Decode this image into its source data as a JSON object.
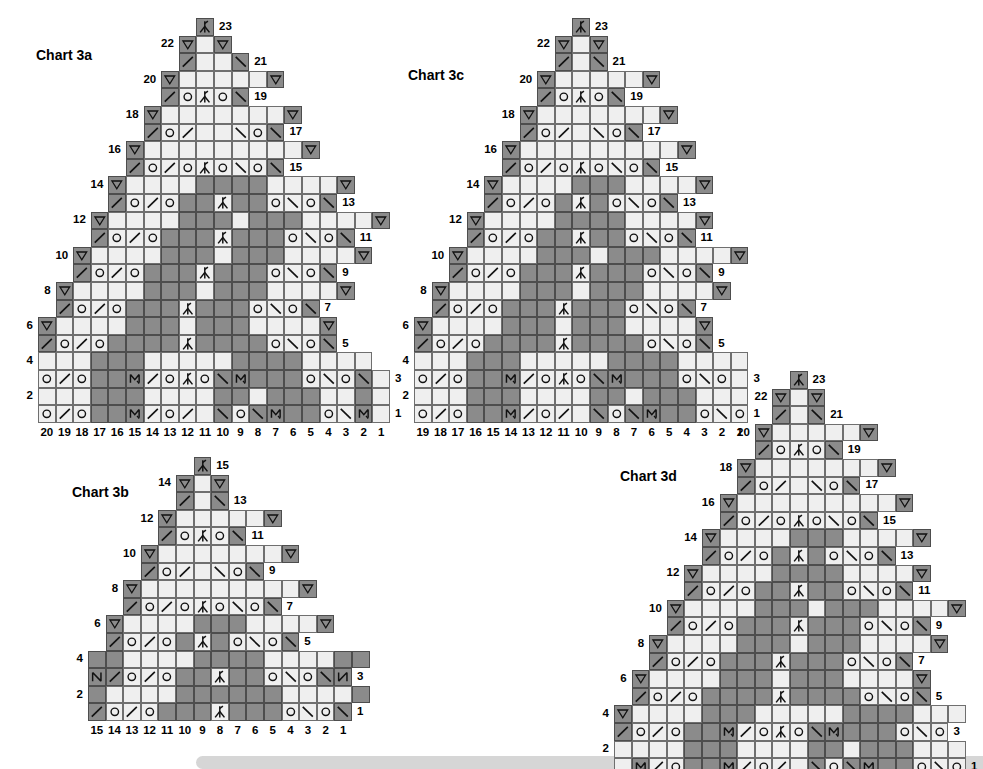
{
  "page": {
    "width": 983,
    "height": 769,
    "background": "#ffffff",
    "cell_size": 17.6,
    "colors": {
      "light_cell": "#efefef",
      "dark_cell": "#8b8b8b",
      "grid_line": "#4a4a4a",
      "text": "#000000",
      "footer_bar": "#d6d6d6"
    }
  },
  "legend_symbols": {
    "blank": "plain-stitch",
    "o": "yarn-over",
    "slash": "k2tog-right-leaning-decrease",
    "backslash": "ssk-left-leaning-decrease",
    "center": "centered-double-decrease",
    "triangle": "purl-or-no-stitch-triangle",
    "m": "make-one-stitch",
    "n": "twisted-stitch"
  },
  "charts": [
    {
      "id": "chart-3a",
      "title": "Chart 3a",
      "columns": 20,
      "rows": 23,
      "col_labels": [
        "20",
        "19",
        "18",
        "17",
        "16",
        "15",
        "14",
        "13",
        "12",
        "11",
        "10",
        "9",
        "8",
        "7",
        "6",
        "5",
        "4",
        "3",
        "2",
        "1"
      ],
      "row_labels_left": [
        "2",
        "4",
        "6",
        "8",
        "10",
        "12",
        "14",
        "16",
        "18",
        "20",
        "22"
      ],
      "row_labels_right": [
        "1",
        "3",
        "5",
        "7",
        "9",
        "11",
        "13",
        "15",
        "17",
        "19",
        "21",
        "23"
      ],
      "origin": {
        "x": 38,
        "y": 18
      },
      "title_pos": {
        "x": 36,
        "y": 47
      }
    },
    {
      "id": "chart-3b",
      "title": "Chart 3b",
      "columns": 15,
      "rows": 15,
      "col_labels": [
        "15",
        "14",
        "13",
        "12",
        "11",
        "10",
        "9",
        "8",
        "7",
        "6",
        "5",
        "4",
        "3",
        "2",
        "1"
      ],
      "row_labels_left": [
        "2",
        "4",
        "6",
        "8",
        "10",
        "12",
        "14"
      ],
      "row_labels_right": [
        "1",
        "3",
        "5",
        "7",
        "9",
        "11",
        "13",
        "15"
      ],
      "origin": {
        "x": 88,
        "y": 457
      },
      "title_pos": {
        "x": 72,
        "y": 484
      }
    },
    {
      "id": "chart-3c",
      "title": "Chart 3c",
      "columns": 19,
      "rows": 23,
      "col_labels": [
        "19",
        "18",
        "17",
        "16",
        "15",
        "14",
        "13",
        "12",
        "11",
        "10",
        "9",
        "8",
        "7",
        "6",
        "5",
        "4",
        "3",
        "2",
        "1"
      ],
      "row_labels_left": [
        "2",
        "4",
        "6",
        "8",
        "10",
        "12",
        "14",
        "16",
        "18",
        "20",
        "22"
      ],
      "row_labels_right": [
        "1",
        "3",
        "5",
        "7",
        "9",
        "11",
        "13",
        "15",
        "17",
        "19",
        "21",
        "23"
      ],
      "origin": {
        "x": 414,
        "y": 18
      },
      "title_pos": {
        "x": 408,
        "y": 67
      }
    },
    {
      "id": "chart-3d",
      "title": "Chart 3d",
      "columns": 20,
      "rows": 23,
      "col_labels": [
        "20",
        "19",
        "18",
        "17",
        "16",
        "15",
        "14",
        "13",
        "12",
        "11",
        "10",
        "9",
        "8",
        "7",
        "6",
        "5",
        "4",
        "3",
        "2",
        "1"
      ],
      "row_labels_left": [
        "2",
        "4",
        "6",
        "8",
        "10",
        "12",
        "14",
        "16",
        "18",
        "20",
        "22"
      ],
      "row_labels_right": [
        "1",
        "3",
        "5",
        "7",
        "9",
        "11",
        "13",
        "15",
        "17",
        "19",
        "21",
        "23"
      ],
      "origin": {
        "x": 614,
        "y": 371
      },
      "title_pos": {
        "x": 620,
        "y": 468
      }
    }
  ],
  "chart_data": {
    "type": "table",
    "note": "Each grid row is a knitting row; cells hold stitch symbols. '.'=blank outside chart, 'L'=light empty, 'D'=dark empty, o=yarn over, /=k2tog, \\\\=ssk, A=centered double decrease, T=triangle, M=make one, N=twisted stitch. Rows listed bottom (row 1) to top (row 23).",
    "grids": {
      "chart-3a": [
        "LoL/LoDDDDMW/LoL/LDD\\Lo\\LMWDDLoL\\LMW",
        "LLLLDDDDDDLLLLLLDDDDLLLLDDDDDDLLLL",
        "LoL/LoDDDDMW/LoLALo\\LMWDDDDLoL\\LoL\\",
        "LLLLLLDDDDDDLLLLLLLLDDDDDDLLLLLLLT",
        "T/LoL/LoDDDDDDLALDDDDDDLoL\\Lo\\",
        ".TLLLLLLLLDDDDLLLLDDDDLLLLLLLLT",
        "./LoL/LoDDDDDALDDDDLoL\\Lo\\",
        "..TLLLLLLLDDDDDLLLDDDDDLLLLLLLT",
        ".../LoL/LoDDDDALDDDDLoL\\Lo\\",
        "...TLLLLLLDDDDDDLDDDDDDLLLLLLT",
        "..../LoL/LoDDDDALDDDDLoL\\Lo\\",
        "....TLLLLLDDDDDDLDDDDDDLLLLLT",
        "...../LoL/LoDDDALDDDLoL\\Lo\\",
        ".....TLLLLLDDDDLDDDDLLLLLT",
        "....../LoL/LoALo\\Lo\\",
        "......TLLLLLLLLLLLLLT",
        "......./LoL/LL\\Lo\\",
        ".......TLLLLLLLLLLT",
        "......../LoALo\\",
        "........TLLLLLT",
        "........./LL\\",
        "..........TLT",
        "..........A"
      ]
    },
    "layout_description": "Four triangular lace charts arranged: 3a top-left, 3b bottom-left, 3c top-right, 3d bottom-right. Each is a stepped pyramid with numbered rows on both sides and stitch columns numbered right-to-left along the bottom."
  }
}
